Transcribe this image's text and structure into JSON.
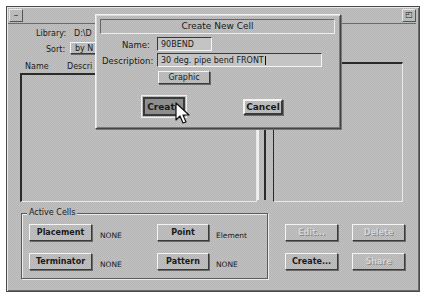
{
  "window": {
    "system_menu_glyph": "–",
    "maximize_glyph": "◰",
    "library_label": "Library:",
    "library_value": "D:\\D",
    "sort_label": "Sort:",
    "sort_value": "by N",
    "columns": [
      "Name",
      "Descri"
    ]
  },
  "active_cells": {
    "title": "Active Cells",
    "rows": [
      {
        "button": "Placement",
        "value": "NONE",
        "button2": "Point",
        "value2": "Element"
      },
      {
        "button": "Terminator",
        "value": "NONE",
        "button2": "Pattern",
        "value2": "NONE"
      }
    ]
  },
  "actions": {
    "edit": "Edit...",
    "delete": "Delete",
    "create": "Create...",
    "share": "Share"
  },
  "dialog": {
    "title": "Create New Cell",
    "name_label": "Name:",
    "name_value": "90BEND",
    "description_label": "Description:",
    "description_value": "30 deg. pipe bend FRONT",
    "type_button": "Graphic",
    "create_button": "Create",
    "cancel_button": "Cancel"
  },
  "colors": {
    "panel": "#b4b4b4",
    "pressed_button": "#8e8e8e",
    "field": "#c4c4c4"
  }
}
